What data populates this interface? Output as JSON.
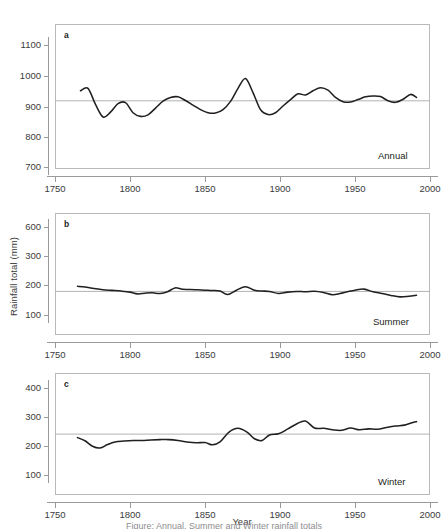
{
  "figure": {
    "shared_ylabel": "Rainfall total (mm)",
    "shared_xlabel": "Year",
    "caption": "Figure: Annual, Summer and Winter rainfall totals",
    "line_color": "#231f20",
    "mean_line_color": "#b3b3b5",
    "frame_color": "#b9b9bb"
  },
  "chart_data": [
    {
      "type": "line",
      "panel": "a",
      "title": "Annual",
      "xlabel": "Year",
      "ylabel": "Rainfall total (mm)",
      "xlim": [
        1750,
        2000
      ],
      "ylim": [
        650,
        1150
      ],
      "xticks": [
        1750,
        1800,
        1850,
        1900,
        1950,
        2000
      ],
      "yticks": [
        700,
        800,
        900,
        1000,
        1100
      ],
      "grid": false,
      "legend": "none",
      "mean_reference": 917,
      "annotations": [
        "a",
        "Annual"
      ],
      "x": [
        1767,
        1772,
        1777,
        1782,
        1787,
        1792,
        1797,
        1802,
        1807,
        1812,
        1817,
        1822,
        1827,
        1832,
        1837,
        1842,
        1847,
        1852,
        1857,
        1862,
        1867,
        1872,
        1877,
        1882,
        1887,
        1892,
        1897,
        1902,
        1907,
        1912,
        1917,
        1922,
        1927,
        1932,
        1937,
        1942,
        1947,
        1952,
        1957,
        1962,
        1967,
        1972,
        1977,
        1982,
        1987,
        1991
      ],
      "y": [
        950,
        958,
        905,
        864,
        880,
        908,
        911,
        878,
        866,
        871,
        893,
        916,
        928,
        930,
        918,
        903,
        888,
        878,
        877,
        888,
        915,
        958,
        990,
        944,
        888,
        872,
        878,
        900,
        921,
        940,
        936,
        950,
        960,
        952,
        928,
        914,
        913,
        921,
        930,
        933,
        931,
        917,
        912,
        922,
        938,
        928
      ]
    },
    {
      "type": "line",
      "panel": "b",
      "title": "Summer",
      "xlabel": "Year",
      "ylabel": "Rainfall total (mm)",
      "xlim": [
        1750,
        2000
      ],
      "ylim": [
        60,
        650
      ],
      "xticks": [
        1750,
        1800,
        1850,
        1900,
        1950,
        2000
      ],
      "yticks": [
        100,
        200,
        300,
        600
      ],
      "grid": false,
      "legend": "none",
      "mean_reference": 234,
      "annotations": [
        "b",
        "Summer"
      ],
      "x": [
        1765,
        1770,
        1776,
        1782,
        1788,
        1794,
        1800,
        1805,
        1810,
        1815,
        1820,
        1825,
        1830,
        1835,
        1840,
        1845,
        1850,
        1855,
        1860,
        1865,
        1871,
        1877,
        1883,
        1888,
        1893,
        1899,
        1905,
        1911,
        1917,
        1923,
        1929,
        1935,
        1940,
        1945,
        1950,
        1956,
        1962,
        1968,
        1974,
        1980,
        1986,
        1991
      ],
      "y": [
        263,
        259,
        250,
        244,
        240,
        236,
        230,
        220,
        224,
        226,
        222,
        232,
        254,
        246,
        245,
        243,
        241,
        239,
        236,
        216,
        241,
        261,
        240,
        236,
        234,
        222,
        230,
        234,
        232,
        235,
        228,
        215,
        222,
        232,
        241,
        247,
        232,
        222,
        211,
        203,
        207,
        212
      ]
    },
    {
      "type": "line",
      "panel": "c",
      "title": "Winter",
      "xlabel": "Year",
      "ylabel": "Rainfall total (mm)",
      "xlim": [
        1750,
        2000
      ],
      "ylim": [
        60,
        450
      ],
      "xticks": [
        1750,
        1800,
        1850,
        1900,
        1950,
        2000
      ],
      "yticks": [
        100,
        200,
        300,
        400
      ],
      "grid": false,
      "legend": "none",
      "mean_reference": 241,
      "annotations": [
        "c",
        "Winter"
      ],
      "x": [
        1765,
        1770,
        1775,
        1780,
        1785,
        1790,
        1796,
        1802,
        1808,
        1814,
        1820,
        1826,
        1832,
        1838,
        1844,
        1850,
        1855,
        1860,
        1866,
        1872,
        1878,
        1883,
        1888,
        1893,
        1899,
        1905,
        1911,
        1917,
        1923,
        1929,
        1935,
        1941,
        1947,
        1953,
        1959,
        1965,
        1971,
        1977,
        1983,
        1988,
        1991
      ],
      "y": [
        229,
        218,
        199,
        193,
        205,
        214,
        217,
        219,
        219,
        221,
        222,
        222,
        219,
        214,
        211,
        212,
        204,
        214,
        248,
        261,
        248,
        225,
        219,
        238,
        242,
        258,
        276,
        286,
        262,
        261,
        256,
        254,
        262,
        256,
        259,
        258,
        264,
        269,
        272,
        280,
        284
      ]
    }
  ]
}
